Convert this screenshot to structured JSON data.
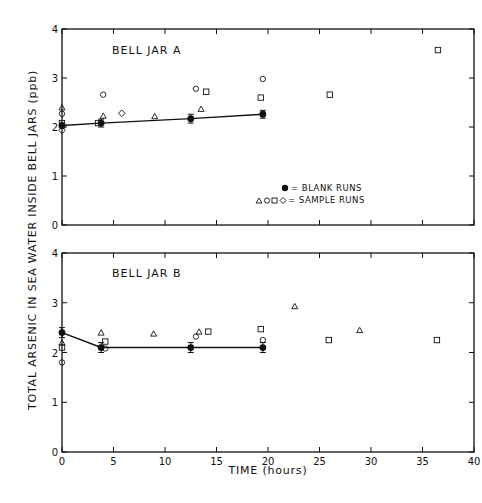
{
  "chart_data": [
    {
      "type": "scatter",
      "panel": "top",
      "title": "BELL JAR A",
      "xlabel": "TIME (hours)",
      "ylabel": "TOTAL ARSENIC IN SEA WATER INSIDE BELL JARS (ppb)",
      "xlim": [
        0,
        40
      ],
      "ylim": [
        0,
        4
      ],
      "xticks": [
        0,
        5,
        10,
        15,
        20,
        25,
        30,
        35,
        40
      ],
      "yticks": [
        0,
        1,
        2,
        3,
        4
      ],
      "grid": false,
      "legend": {
        "position": "lower right",
        "entries": [
          {
            "marker": "filled-circle",
            "label": "= BLANK RUNS"
          },
          {
            "marker": "triangle circle square diamond",
            "label": "= SAMPLE RUNS"
          }
        ]
      },
      "series": [
        {
          "name": "Blank runs",
          "marker": "filled-circle",
          "line": true,
          "points": [
            {
              "x": 0,
              "y": 2.03,
              "err": 0.05
            },
            {
              "x": 3.8,
              "y": 2.08,
              "err": 0.08
            },
            {
              "x": 12.5,
              "y": 2.17,
              "err": 0.09
            },
            {
              "x": 19.5,
              "y": 2.26,
              "err": 0.08
            }
          ]
        },
        {
          "name": "Sample runs (triangle)",
          "marker": "triangle",
          "points": [
            {
              "x": 0,
              "y": 2.4
            },
            {
              "x": 4,
              "y": 2.23
            },
            {
              "x": 9,
              "y": 2.22
            },
            {
              "x": 13.5,
              "y": 2.37
            }
          ]
        },
        {
          "name": "Sample runs (circle)",
          "marker": "circle",
          "points": [
            {
              "x": 0,
              "y": 2.27
            },
            {
              "x": 4,
              "y": 2.66
            },
            {
              "x": 13,
              "y": 2.78
            },
            {
              "x": 19.5,
              "y": 2.98
            }
          ]
        },
        {
          "name": "Sample runs (square)",
          "marker": "square",
          "points": [
            {
              "x": 0,
              "y": 2.08
            },
            {
              "x": 3.5,
              "y": 2.08
            },
            {
              "x": 14,
              "y": 2.72
            },
            {
              "x": 19.3,
              "y": 2.6
            },
            {
              "x": 26,
              "y": 2.66
            },
            {
              "x": 36.5,
              "y": 3.57
            }
          ]
        },
        {
          "name": "Sample runs (diamond)",
          "marker": "diamond",
          "points": [
            {
              "x": 0,
              "y": 1.93
            },
            {
              "x": 5.8,
              "y": 2.28
            }
          ]
        }
      ]
    },
    {
      "type": "scatter",
      "panel": "bottom",
      "title": "BELL JAR B",
      "xlabel": "TIME (hours)",
      "ylabel": "TOTAL ARSENIC IN SEA WATER INSIDE BELL JARS (ppb)",
      "xlim": [
        0,
        40
      ],
      "ylim": [
        0,
        4
      ],
      "xticks": [
        0,
        5,
        10,
        15,
        20,
        25,
        30,
        35,
        40
      ],
      "yticks": [
        0,
        1,
        2,
        3,
        4
      ],
      "grid": false,
      "series": [
        {
          "name": "Blank runs",
          "marker": "filled-circle",
          "line": true,
          "points": [
            {
              "x": 0,
              "y": 2.4,
              "err": 0.1
            },
            {
              "x": 3.8,
              "y": 2.1,
              "err": 0.1
            },
            {
              "x": 12.5,
              "y": 2.1,
              "err": 0.1
            },
            {
              "x": 19.5,
              "y": 2.1,
              "err": 0.1
            }
          ]
        },
        {
          "name": "Sample runs (triangle)",
          "marker": "triangle",
          "points": [
            {
              "x": 0,
              "y": 2.2
            },
            {
              "x": 3.8,
              "y": 2.4
            },
            {
              "x": 8.9,
              "y": 2.38
            },
            {
              "x": 13.3,
              "y": 2.42
            },
            {
              "x": 22.6,
              "y": 2.93
            },
            {
              "x": 28.9,
              "y": 2.45
            }
          ]
        },
        {
          "name": "Sample runs (circle)",
          "marker": "circle",
          "points": [
            {
              "x": 0,
              "y": 1.8
            },
            {
              "x": 4.2,
              "y": 2.08
            },
            {
              "x": 13,
              "y": 2.32
            },
            {
              "x": 19.5,
              "y": 2.25
            }
          ]
        },
        {
          "name": "Sample runs (square)",
          "marker": "square",
          "points": [
            {
              "x": 0,
              "y": 2.1
            },
            {
              "x": 4.2,
              "y": 2.22
            },
            {
              "x": 14.2,
              "y": 2.42
            },
            {
              "x": 19.3,
              "y": 2.47
            },
            {
              "x": 25.9,
              "y": 2.25
            },
            {
              "x": 36.4,
              "y": 2.25
            }
          ]
        }
      ]
    }
  ],
  "labels": {
    "ylabel": "TOTAL ARSENIC IN SEA WATER INSIDE BELL JARS (ppb)",
    "xlabel": "TIME (hours)",
    "top_title": "BELL JAR A",
    "bottom_title": "BELL JAR B",
    "legend_blank": "= BLANK RUNS",
    "legend_sample": "= SAMPLE RUNS",
    "xticks": [
      "0",
      "5",
      "10",
      "15",
      "20",
      "25",
      "30",
      "35",
      "40"
    ],
    "yticks": [
      "0",
      "1",
      "2",
      "3",
      "4"
    ]
  }
}
